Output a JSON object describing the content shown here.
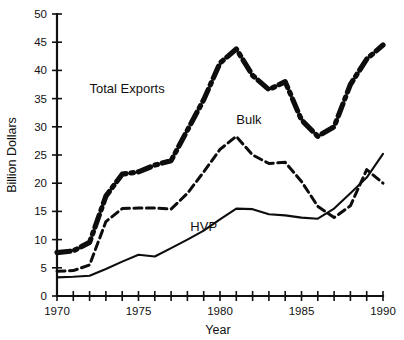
{
  "chart_data": {
    "type": "line",
    "title": "",
    "xlabel": "Year",
    "ylabel": "Billion Dollars",
    "xlim": [
      1970,
      1990
    ],
    "ylim": [
      0,
      50
    ],
    "ytick_step": 5,
    "xtick_step": 1,
    "xtick_label_step": 5,
    "grid": false,
    "legend": "inline-annotations",
    "x": [
      1970,
      1971,
      1972,
      1973,
      1974,
      1975,
      1976,
      1977,
      1978,
      1979,
      1980,
      1981,
      1982,
      1983,
      1984,
      1985,
      1986,
      1987,
      1988,
      1989,
      1990
    ],
    "yticks": [
      0,
      5,
      10,
      15,
      20,
      25,
      30,
      35,
      40,
      45,
      50
    ],
    "xticks": [
      1970,
      1971,
      1972,
      1973,
      1974,
      1975,
      1976,
      1977,
      1978,
      1979,
      1980,
      1981,
      1982,
      1983,
      1984,
      1985,
      1986,
      1987,
      1988,
      1989,
      1990
    ],
    "xtick_labels": [
      "1970",
      "",
      "",
      "",
      "",
      "1975",
      "",
      "",
      "",
      "",
      "1980",
      "",
      "",
      "",
      "",
      "1985",
      "",
      "",
      "",
      "",
      "1990"
    ],
    "ytick_labels": [
      "0",
      "5",
      "10",
      "15",
      "20",
      "25",
      "30",
      "35",
      "40",
      "45",
      "50"
    ],
    "series": [
      {
        "name": "Total Exports",
        "style": "dash-dot",
        "linewidth": "thick",
        "color": "#0d0d0d",
        "label_x": 1974.3,
        "label_y": 36.0,
        "values": [
          7.7,
          8.0,
          9.5,
          17.7,
          21.6,
          22.0,
          23.2,
          24.0,
          29.4,
          34.8,
          41.3,
          43.8,
          39.1,
          36.6,
          38.0,
          31.2,
          28.3,
          30.0,
          37.5,
          42.0,
          44.5
        ]
      },
      {
        "name": "Bulk",
        "style": "dashed",
        "linewidth": "medium",
        "color": "#0d0d0d",
        "label_x": 1981.0,
        "label_y": 30.5,
        "values": [
          4.4,
          4.5,
          5.5,
          13.2,
          15.5,
          15.6,
          15.6,
          15.4,
          18.2,
          22.0,
          26.0,
          28.3,
          25.0,
          23.5,
          23.7,
          20.3,
          15.9,
          13.9,
          16.0,
          22.4,
          20.0
        ]
      },
      {
        "name": "HVP",
        "style": "solid",
        "linewidth": "thin",
        "color": "#0d0d0d",
        "label_x": 1979.0,
        "label_y": 11.5,
        "values": [
          3.3,
          3.4,
          3.6,
          4.8,
          6.1,
          7.3,
          7.0,
          8.5,
          10.0,
          11.6,
          13.6,
          15.5,
          15.4,
          14.5,
          14.3,
          13.9,
          13.7,
          15.5,
          18.2,
          21.0,
          25.2
        ]
      }
    ]
  },
  "labels": {
    "y_axis_title": "Billion Dollars",
    "x_axis_title": "Year",
    "series_total": "Total Exports",
    "series_bulk": "Bulk",
    "series_hvp": "HVP"
  }
}
